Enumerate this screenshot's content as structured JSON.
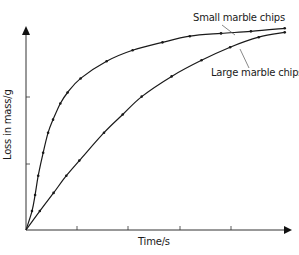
{
  "chart_data": {
    "type": "line",
    "title": "",
    "xlabel": "Time/s",
    "ylabel": "Loss in mass/g",
    "grid": false,
    "legend_position": "inline annotations (top right)",
    "x_ticks": 4,
    "y_ticks": 2,
    "x_tick_labels": [],
    "y_tick_labels": [],
    "xlim": [
      0,
      10
    ],
    "ylim": [
      0,
      7.9
    ],
    "series": [
      {
        "name": "Small marble chips",
        "x": [
          0,
          0.23,
          0.35,
          0.47,
          0.66,
          0.85,
          1.04,
          1.32,
          1.6,
          2.1,
          3.1,
          4.1,
          5.25,
          6.3,
          7.5,
          8.65,
          9.95
        ],
        "y": [
          0,
          0.74,
          1.37,
          2.12,
          3.02,
          3.8,
          4.31,
          4.94,
          5.37,
          5.92,
          6.59,
          7.02,
          7.33,
          7.57,
          7.68,
          7.76,
          7.88
        ]
      },
      {
        "name": "Large marble chips",
        "x": [
          0,
          0.53,
          1.06,
          1.55,
          2.05,
          3.0,
          3.72,
          4.45,
          5.6,
          6.75,
          7.85,
          8.95,
          9.95
        ],
        "y": [
          0,
          0.74,
          1.45,
          2.12,
          2.71,
          3.8,
          4.51,
          5.21,
          6.0,
          6.63,
          7.14,
          7.53,
          7.72
        ]
      }
    ],
    "annotations": [
      {
        "text": "Small marble chips",
        "points_to": "Small marble chips curve"
      },
      {
        "text": "Large marble chips",
        "points_to": "Large marble chips curve"
      }
    ]
  },
  "labels": {
    "ylabel": "Loss in mass/g",
    "xlabel": "Time/s",
    "small": "Small marble chips",
    "large": "Large marble chips"
  },
  "colors": {
    "line": "#1a1a1a",
    "axis": "#333333",
    "leader": "#555555"
  }
}
